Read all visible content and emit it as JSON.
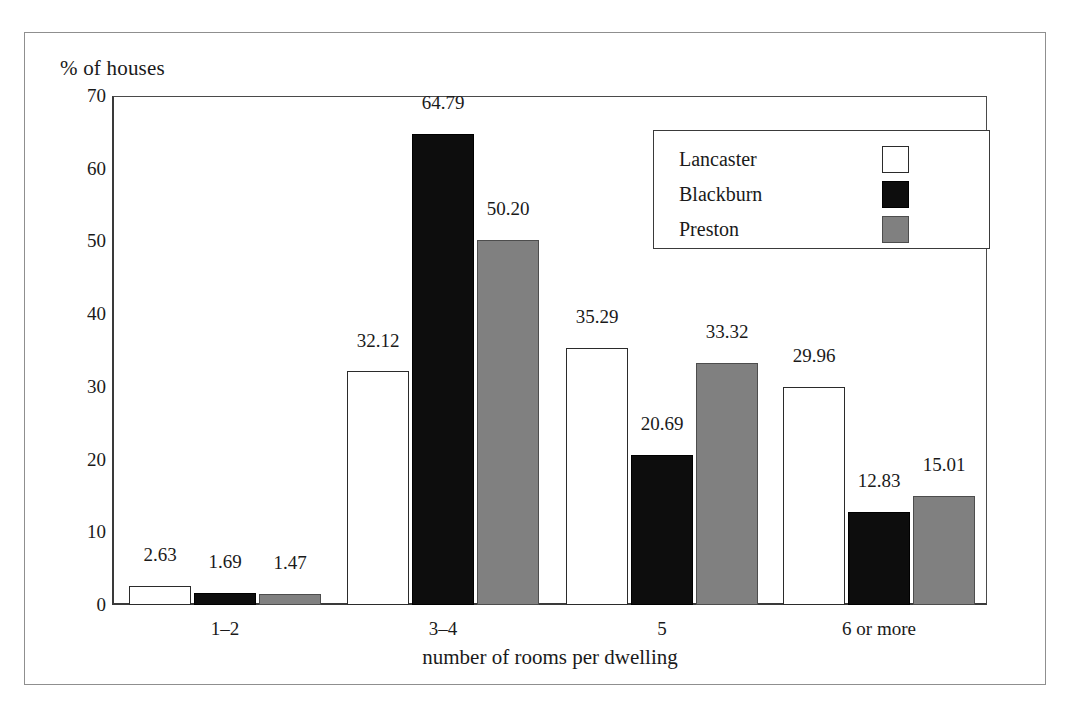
{
  "chart_data": {
    "type": "bar",
    "title": "",
    "xlabel": "number of rooms per dwelling",
    "ylabel": "% of houses",
    "categories": [
      "1–2",
      "3–4",
      "5",
      "6 or more"
    ],
    "ylim": [
      0,
      70
    ],
    "yticks": [
      0,
      10,
      20,
      30,
      40,
      50,
      60,
      70
    ],
    "ytick_labels": [
      "0",
      "10",
      "20",
      "30",
      "40",
      "50",
      "60",
      "70"
    ],
    "grid": false,
    "legend_position": "upper right",
    "series": [
      {
        "name": "Lancaster",
        "color": "#ffffff",
        "edge_color": "#2b2b2b",
        "values": [
          2.63,
          32.12,
          35.29,
          29.96
        ],
        "labels": [
          "2.63",
          "32.12",
          "35.29",
          "29.96"
        ]
      },
      {
        "name": "Blackburn",
        "color": "#0d0d0d",
        "edge_color": "#000000",
        "values": [
          1.69,
          64.79,
          20.69,
          12.83
        ],
        "labels": [
          "1.69",
          "64.79",
          "20.69",
          "12.83"
        ]
      },
      {
        "name": "Preston",
        "color": "#808080",
        "edge_color": "#4d4d4d",
        "values": [
          1.47,
          50.2,
          33.32,
          15.01
        ],
        "labels": [
          "1.47",
          "50.20",
          "33.32",
          "15.01"
        ]
      }
    ]
  },
  "legend": {
    "items": [
      {
        "label": "Lancaster",
        "swatch": "swatch-white"
      },
      {
        "label": "Blackburn",
        "swatch": "swatch-black"
      },
      {
        "label": "Preston",
        "swatch": "swatch-gray"
      }
    ]
  },
  "axes": {
    "y_title": "% of houses",
    "x_title": "number of rooms per dwelling",
    "y_ticks": [
      "70",
      "60",
      "50",
      "40",
      "30",
      "20",
      "10",
      "0"
    ],
    "x_categories": [
      "1–2",
      "3–4",
      "5",
      "6 or more"
    ]
  },
  "colors": {
    "lancaster": "#ffffff",
    "blackburn": "#0d0d0d",
    "preston": "#808080",
    "axis": "#3a3a3a",
    "frame": "#8f8f8f",
    "text": "#1a1a1a"
  }
}
